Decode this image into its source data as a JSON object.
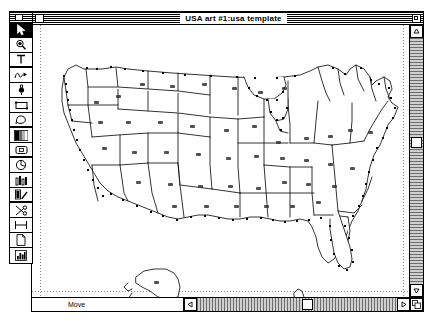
{
  "app": {
    "platform": "classic-macintosh",
    "kind": "vector-drawing-application"
  },
  "document_window": {
    "title": "USA art #1:usa template",
    "close_box_name": "close-box",
    "zoom_box_name": "zoom-box",
    "status_text": "Move",
    "scrollbars": {
      "vertical": {
        "up_arrow": "▲",
        "down_arrow": "▼",
        "thumb_position_percent": 42
      },
      "horizontal": {
        "left_arrow": "◀",
        "right_arrow": "▶",
        "thumb_position_percent": 52
      }
    },
    "grow_box_name": "grow-box"
  },
  "tool_palette": {
    "title": "",
    "selected_index": 0,
    "tools": [
      {
        "name": "arrow-select-tool",
        "icon": "arrow-icon",
        "selected": true
      },
      {
        "name": "zoom-tool",
        "icon": "magnifier-icon",
        "selected": false
      },
      {
        "name": "text-tool",
        "icon": "text-t-icon",
        "selected": false
      },
      {
        "name": "freehand-tool",
        "icon": "squiggle-icon",
        "selected": false
      },
      {
        "name": "brush-tool",
        "icon": "brush-icon",
        "selected": false
      },
      {
        "name": "rectangle-tool",
        "icon": "rectangle-icon",
        "selected": false
      },
      {
        "name": "polygon-tool",
        "icon": "polygon-icon",
        "selected": false
      },
      {
        "name": "fill-pattern-tool",
        "icon": "gradient-icon",
        "selected": false
      },
      {
        "name": "rounded-rect-tool",
        "icon": "rounded-rect-icon",
        "selected": false
      },
      {
        "name": "arc-tool",
        "icon": "arc-icon",
        "selected": false
      },
      {
        "name": "column-chart-tool",
        "icon": "columns-icon",
        "selected": false
      },
      {
        "name": "pen-tool",
        "icon": "pen-icon",
        "selected": false
      },
      {
        "name": "scissors-tool",
        "icon": "scissors-icon",
        "selected": false
      },
      {
        "name": "dimension-tool",
        "icon": "dimension-icon",
        "selected": false
      },
      {
        "name": "page-tool",
        "icon": "page-icon",
        "selected": false
      },
      {
        "name": "bar-chart-tool",
        "icon": "bar-chart-icon",
        "selected": false
      }
    ]
  },
  "canvas": {
    "artwork_name": "usa-map-template",
    "description": "Outline vector map of the United States with state boundaries, anchor points along coastlines, tiny state labels, plus Alaska and Hawaii insets",
    "guides": {
      "left_margin": true,
      "right_margin": true,
      "bottom_margin": true
    },
    "colors": {
      "stroke": "#000000",
      "fill": "#ffffff",
      "guide": "#888888"
    }
  }
}
